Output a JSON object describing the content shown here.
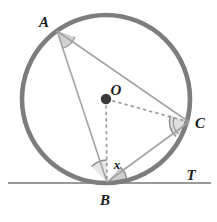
{
  "figure": {
    "background_color": "#ffffff"
  },
  "colors": {
    "circle_stroke": "#7d7d7d",
    "chord_stroke": "#a3a3a3",
    "dashed_stroke": "#9a9a9a",
    "tangent_stroke": "#9a9a9a",
    "center_dot": "#3a3a3a",
    "angle_fill": "#c9c9c9",
    "angle_arc": "#8f8f8f",
    "label_color": "#1b1b1b"
  },
  "circle": {
    "center_x": 106,
    "center_y": 99,
    "radius": 84,
    "stroke_width": 4.6
  },
  "points": {
    "A": {
      "x": 57,
      "y": 31,
      "label": "A",
      "label_x": 44,
      "label_y": 27
    },
    "B": {
      "x": 107,
      "y": 182,
      "label": "B",
      "label_x": 105,
      "label_y": 205
    },
    "C": {
      "x": 189,
      "y": 122,
      "label": "C",
      "label_x": 197,
      "label_y": 128
    },
    "O": {
      "x": 106,
      "y": 99,
      "label": "O",
      "label_x": 113,
      "label_y": 95,
      "dot_radius": 5.2
    },
    "T": {
      "label": "T",
      "label_x": 188,
      "label_y": 180
    }
  },
  "segments": [
    {
      "name": "chord-AB",
      "from": "A",
      "to": "B",
      "style": "solid",
      "stroke_width": 1.6
    },
    {
      "name": "chord-AC",
      "from": "A",
      "to": "C",
      "style": "solid",
      "stroke_width": 1.6
    },
    {
      "name": "chord-BC",
      "from": "B",
      "to": "C",
      "style": "solid",
      "stroke_width": 1.6
    },
    {
      "name": "radius-OB",
      "from": "O",
      "to": "B",
      "style": "dashed",
      "stroke_width": 1.6
    },
    {
      "name": "radius-OC",
      "from": "O",
      "to": "C",
      "style": "dashed",
      "stroke_width": 1.6
    }
  ],
  "tangent_line": {
    "name": "tangent-at-B",
    "x1": 8,
    "y1": 183,
    "x2": 211,
    "y2": 183,
    "stroke_width": 1.8,
    "label": "T"
  },
  "angle_marks": [
    {
      "name": "angle-at-A",
      "vertex": "A",
      "radius": 18,
      "label": ""
    },
    {
      "name": "angle-at-C",
      "vertex": "C",
      "radius": 20,
      "label": ""
    },
    {
      "name": "angle-x-at-B",
      "vertex": "B",
      "radius": 22,
      "label": "x",
      "label_x": 116,
      "label_y": 168
    },
    {
      "name": "angle-tangent-at-B",
      "vertex": "B",
      "radius": 20,
      "label": ""
    }
  ],
  "labels": {
    "x": "x",
    "A": "A",
    "B": "B",
    "C": "C",
    "O": "O",
    "T": "T"
  }
}
